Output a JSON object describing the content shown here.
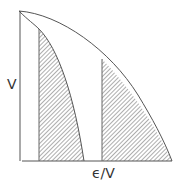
{
  "diagram": {
    "y_label": "V",
    "x_label": "ϵ/V",
    "colors": {
      "line": "#555555",
      "hatch": "#777777",
      "background": "#ffffff"
    },
    "regions": [
      {
        "name": "left-shaded-region",
        "pattern": "diagonal-hatch"
      },
      {
        "name": "right-shaded-region",
        "pattern": "diagonal-hatch"
      }
    ]
  }
}
